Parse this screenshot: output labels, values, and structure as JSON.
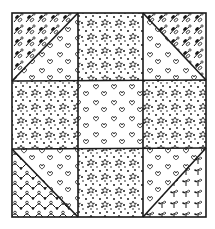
{
  "artwork": {
    "subject": "hand-drawn nine-patch quilt block",
    "colors": {
      "ink": "#1a1a1a",
      "paper": "#ffffff"
    },
    "grid": {
      "rows": 3,
      "cols": 3
    },
    "blocks": [
      {
        "pos": "top-left",
        "type": "half-square-triangle",
        "patterns": [
          "leaf-sprigs",
          "hearts"
        ],
        "diagonal": "bl-tr"
      },
      {
        "pos": "top-center",
        "type": "solid",
        "patterns": [
          "stars-dots"
        ]
      },
      {
        "pos": "top-right",
        "type": "half-square-triangle",
        "patterns": [
          "hearts",
          "leaf-sprigs"
        ],
        "diagonal": "tl-br"
      },
      {
        "pos": "middle-left",
        "type": "solid",
        "patterns": [
          "stars-dots"
        ]
      },
      {
        "pos": "center",
        "type": "solid",
        "patterns": [
          "hearts"
        ]
      },
      {
        "pos": "middle-right",
        "type": "solid",
        "patterns": [
          "stars-dots"
        ]
      },
      {
        "pos": "bottom-left",
        "type": "half-square-triangle",
        "patterns": [
          "vines",
          "hearts"
        ],
        "diagonal": "tl-br"
      },
      {
        "pos": "bottom-center",
        "type": "solid",
        "patterns": [
          "stars-dots"
        ]
      },
      {
        "pos": "bottom-right",
        "type": "half-square-triangle",
        "patterns": [
          "hearts",
          "sprouts"
        ],
        "diagonal": "bl-tr"
      }
    ]
  }
}
